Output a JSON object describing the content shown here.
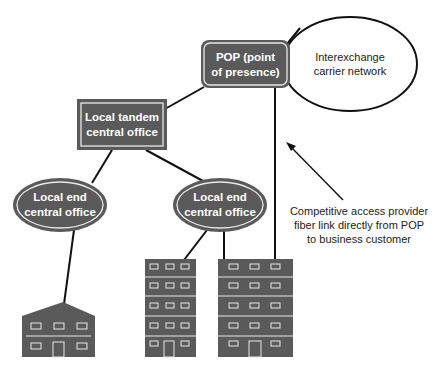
{
  "diagram": {
    "nodes": {
      "pop": {
        "line1": "POP (point",
        "line2": "of presence)"
      },
      "interexchange": {
        "line1": "Interexchange",
        "line2": "carrier network"
      },
      "tandem": {
        "line1": "Local tandem",
        "line2": "central office"
      },
      "end_office_left": {
        "line1": "Local end",
        "line2": "central office"
      },
      "end_office_right": {
        "line1": "Local end",
        "line2": "central office"
      }
    },
    "buildings": [
      {
        "type": "house",
        "floors": 2,
        "windows_per_floor": 3
      },
      {
        "type": "office",
        "floors": 5,
        "windows_per_floor": 3
      },
      {
        "type": "office",
        "floors": 5,
        "windows_per_floor": 3
      }
    ],
    "annotation": {
      "line1": "Competitive access provider",
      "line2": "fiber link directly from POP",
      "line3": "to business customer"
    },
    "colors": {
      "node_fill": "#5a5a5a",
      "node_border": "#e8e8e8",
      "link": "#111111",
      "background": "#ffffff"
    }
  }
}
